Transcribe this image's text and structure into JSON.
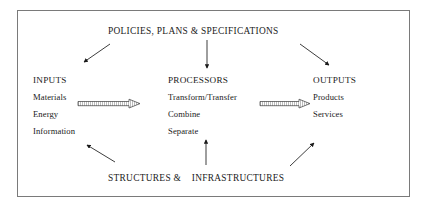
{
  "diagram": {
    "type": "systems-flow-diagram",
    "frame": {
      "border_color": "#7a7a7a",
      "background": "#ffffff"
    },
    "top_banner": {
      "label": "POLICIES, PLANS & SPECIFICATIONS"
    },
    "bottom_banner": {
      "label": "STRUCTURES &    INFRASTRUCTURES"
    },
    "columns": [
      {
        "id": "inputs",
        "heading": "INPUTS",
        "items": [
          "Materials",
          "Energy",
          "Information"
        ]
      },
      {
        "id": "processors",
        "heading": "PROCESSORS",
        "items": [
          "Transform/Transfer",
          "Combine",
          "Separate"
        ]
      },
      {
        "id": "outputs",
        "heading": "OUTPUTS",
        "items": [
          "Products",
          "Services"
        ]
      }
    ],
    "connectors": [
      {
        "id": "policies-to-inputs",
        "style": "thin-line-arrow",
        "direction": "down-left"
      },
      {
        "id": "policies-to-processors",
        "style": "thin-line-arrow",
        "direction": "down"
      },
      {
        "id": "policies-to-outputs",
        "style": "thin-line-arrow",
        "direction": "down-right"
      },
      {
        "id": "inputs-to-processors",
        "style": "hollow-block-arrow",
        "direction": "right"
      },
      {
        "id": "processors-to-outputs",
        "style": "hollow-block-arrow",
        "direction": "right"
      },
      {
        "id": "structures-to-inputs",
        "style": "thin-line-arrow",
        "direction": "up-left"
      },
      {
        "id": "structures-to-processors",
        "style": "thin-line-arrow",
        "direction": "up"
      },
      {
        "id": "structures-to-outputs",
        "style": "thin-line-arrow",
        "direction": "up-right"
      }
    ],
    "colors": {
      "text": "#1a1a1a",
      "stroke": "#1a1a1a",
      "frame": "#7a7a7a"
    }
  }
}
